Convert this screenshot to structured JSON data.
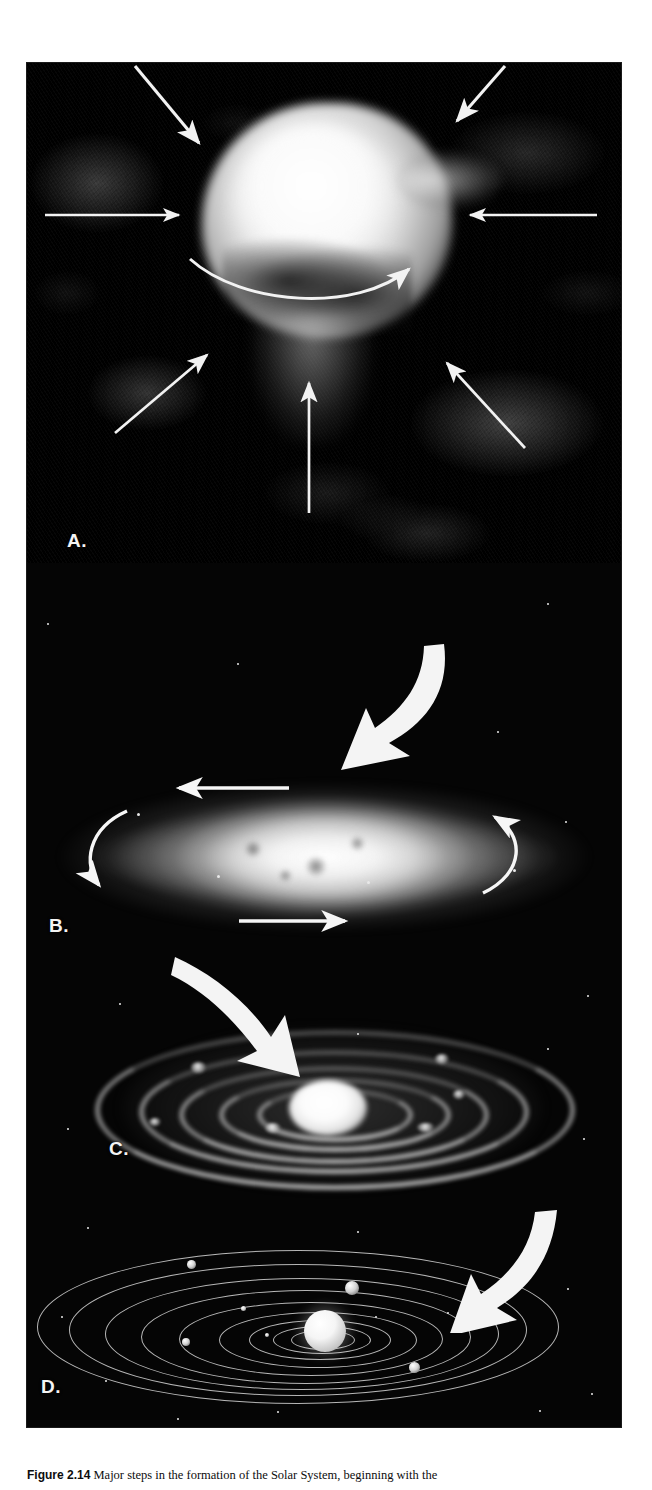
{
  "figure": {
    "alt_title": "Four-stage illustration of solar system formation from a collapsing interstellar cloud",
    "background_color": "#050505",
    "page_background": "#ffffff",
    "arrow_color": "#f2f2f2"
  },
  "panels": [
    {
      "id": "A",
      "label": "A.",
      "name": "collapsing-interstellar-cloud",
      "description": "A dense interstellar gas and dust cloud collapsing inward under its own gravity; thin straight arrows point inward from all sides and a curved arrow indicates the onset of rotation.",
      "arrow_count": 8,
      "has_rotation_arrow": true
    },
    {
      "id": "B",
      "label": "B.",
      "name": "flattened-rotating-disk",
      "description": "The contracting cloud spins faster and flattens into a rotating disk with a hot central concentration; four curved arrows show the direction of rotation.",
      "rotation_arrows": 4
    },
    {
      "id": "C",
      "label": "C.",
      "name": "protoplanetary-disk-with-rings",
      "description": "Material in the disk condenses into concentric rings of dust and planetesimals around the bright young protosun.",
      "ring_count": 5
    },
    {
      "id": "D",
      "label": "D.",
      "name": "formed-solar-system",
      "description": "Rings coalesce into planets that orbit the new star along nearly circular, coplanar orbits.",
      "orbit_count": 9,
      "planet_count": 5
    }
  ],
  "transitions": [
    {
      "name": "arrow-a-to-b",
      "from": "A",
      "to": "B",
      "direction": "down-left"
    },
    {
      "name": "arrow-b-to-c",
      "from": "B",
      "to": "C",
      "direction": "down-right"
    },
    {
      "name": "arrow-c-to-d",
      "from": "C",
      "to": "D",
      "direction": "down-left"
    }
  ],
  "caption": {
    "number": "Figure 2.14",
    "text": "Major steps in the formation of the Solar System, beginning with the"
  }
}
